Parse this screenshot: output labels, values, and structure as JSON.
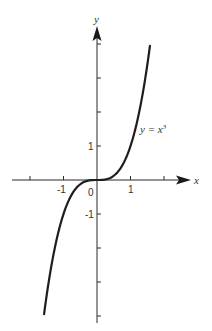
{
  "chart_data": {
    "type": "line",
    "title": "",
    "xlabel": "x",
    "ylabel": "y",
    "xlim": [
      -2.5,
      2.8
    ],
    "ylim": [
      -4.2,
      4.5
    ],
    "grid": false,
    "x_ticks": [
      -2,
      -1,
      0,
      1,
      2
    ],
    "y_ticks": [
      -4,
      -3,
      -2,
      -1,
      0,
      1,
      2,
      3,
      4
    ],
    "x_tick_labels": [
      {
        "value": -1,
        "text": "-1"
      },
      {
        "value": 0,
        "text": "0"
      },
      {
        "value": 1,
        "text": "1"
      }
    ],
    "y_tick_labels": [
      {
        "value": 1,
        "text": "1"
      },
      {
        "value": -1,
        "text": "-1"
      }
    ],
    "series": [
      {
        "name": "y = x^3",
        "function": "x^3",
        "x_range": [
          -1.58,
          1.58
        ],
        "x": [
          -1.58,
          -1.5,
          -1.25,
          -1.0,
          -0.75,
          -0.5,
          -0.25,
          0,
          0.25,
          0.5,
          0.75,
          1.0,
          1.25,
          1.5,
          1.58
        ],
        "values": [
          -3.94,
          -3.375,
          -1.953,
          -1.0,
          -0.422,
          -0.125,
          -0.016,
          0,
          0.016,
          0.125,
          0.422,
          1.0,
          1.953,
          3.375,
          3.94
        ]
      }
    ],
    "annotations": [
      {
        "text": "y = x",
        "superscript": "3",
        "x": 1.3,
        "y": 1.5
      }
    ],
    "legend": null
  },
  "labels": {
    "x_axis": "x",
    "y_axis": "y",
    "curve_label_base": "y = x",
    "curve_label_exp": "3",
    "tick_x_neg1": "-1",
    "tick_x_0": "0",
    "tick_x_1": "1",
    "tick_y_1": "1",
    "tick_y_neg1": "-1"
  },
  "colors": {
    "axis": "#2a2a2a",
    "curve": "#1e1e1e",
    "text": "#333333",
    "background": "#ffffff"
  }
}
